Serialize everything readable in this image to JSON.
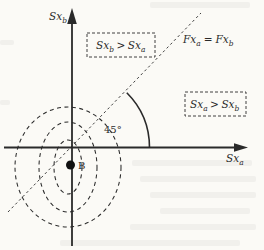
{
  "figure": {
    "y_axis_label": {
      "base": "Sx",
      "sub": "b"
    },
    "x_axis_label": {
      "base": "Sx",
      "sub": "a"
    },
    "diagonal_label": {
      "lhs_base": "Fx",
      "lhs_sub": "a",
      "relation": "=",
      "rhs_base": "Fx",
      "rhs_sub": "b"
    },
    "region_upper_left": {
      "lhs_base": "Sx",
      "lhs_sub": "b",
      "relation": ">",
      "rhs_base": "Sx",
      "rhs_sub": "a"
    },
    "region_lower_right": {
      "lhs_base": "Sx",
      "lhs_sub": "a",
      "relation": ">",
      "rhs_base": "Sx",
      "rhs_sub": "b"
    },
    "angle_label": "45°",
    "point_label": "B",
    "colors": {
      "ink": "#2a2a2a",
      "background": "#fbfaf6"
    }
  }
}
